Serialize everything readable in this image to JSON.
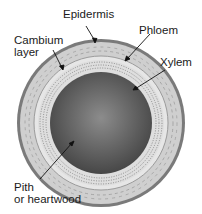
{
  "diagram": {
    "labels": {
      "epidermis": "Epidermis",
      "phloem": "Phloem",
      "cambium_line1": "Cambium",
      "cambium_line2": "layer",
      "xylem": "Xylem",
      "pith_line1": "Pith",
      "pith_line2": "or heartwood"
    },
    "colors": {
      "epidermis": "#7a7a7a",
      "phloem": "#c8c8c8",
      "cambium": "#e4e4e4",
      "xylem": "#dcdcdc",
      "pith_center": "#8a8a8a",
      "pith_edge": "#4a4a4a",
      "text": "#1a1a1a"
    }
  }
}
